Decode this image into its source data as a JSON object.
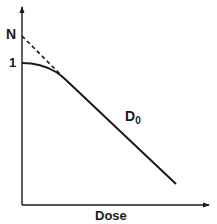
{
  "diagram": {
    "type": "cell-survival-curve",
    "labels": {
      "y_high": "N",
      "y_unit": "1",
      "slope_main": "D",
      "slope_sub": "0",
      "x_axis": "Dose"
    },
    "colors": {
      "line": "#1a1a1a",
      "background": "#ffffff"
    },
    "elements": {
      "shoulder_curve": "solid curve starting at 1 on y-axis, bending into straight line",
      "extrapolation": "dashed line from N on y-axis tangent to straight portion",
      "straight_portion_label": "D0"
    }
  }
}
